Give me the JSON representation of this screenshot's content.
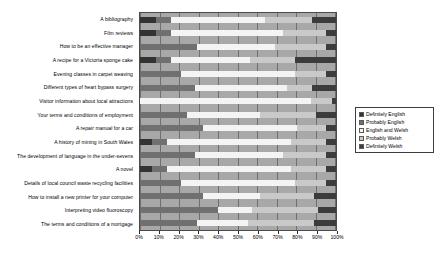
{
  "chart_data": {
    "type": "bar",
    "orientation": "horizontal",
    "stacked": true,
    "normalized_percent": true,
    "title": "",
    "subtitle": "",
    "xlabel": "",
    "ylabel": "",
    "xlim": [
      0,
      100
    ],
    "grid": true,
    "legend_position": "right",
    "xticks": [
      "0%",
      "10%",
      "20%",
      "30%",
      "40%",
      "50%",
      "60%",
      "70%",
      "80%",
      "90%",
      "100%"
    ],
    "xtick_values": [
      0,
      10,
      20,
      30,
      40,
      50,
      60,
      70,
      80,
      90,
      100
    ],
    "categories": [
      "A bibliography",
      "Film reviews",
      "How to be an effective manager",
      "A recipe for a Victoria sponge cake",
      "Evening classes in carpet weaving",
      "Different types of heart bypass surgery",
      "Visitor information about local attractions",
      "Your terms and conditions of employment",
      "A repair manual for a car",
      "A history of mining in South Wales",
      "The development of language in the under-sevens",
      "A novel",
      "Details of local council waste recycling facilities",
      "How to install a new printer for your computer",
      "Interpreting video fluoroscopy",
      "The terms and conditions of a mortgage"
    ],
    "series": [
      {
        "name": "Definitely English",
        "color": "#333333",
        "values": [
          8,
          8,
          0,
          8,
          0,
          0,
          0,
          0,
          0,
          6,
          0,
          6,
          0,
          0,
          0,
          0
        ]
      },
      {
        "name": "Probably English",
        "color": "#707070",
        "values": [
          8,
          8,
          29,
          8,
          21,
          28,
          0,
          24,
          32,
          8,
          28,
          8,
          21,
          32,
          40,
          29
        ]
      },
      {
        "name": "English and Welsh",
        "color": "#f4f4f4",
        "values": [
          48,
          57,
          40,
          40,
          58,
          47,
          87,
          37,
          48,
          63,
          45,
          63,
          58,
          29,
          17,
          26
        ]
      },
      {
        "name": "Probably Welsh",
        "color": "#c9c9c9",
        "values": [
          24,
          22,
          26,
          23,
          16,
          13,
          11,
          29,
          15,
          18,
          22,
          18,
          16,
          28,
          34,
          34
        ]
      },
      {
        "name": "Definitely Welsh",
        "color": "#3c3c3c",
        "values": [
          12,
          5,
          5,
          21,
          5,
          12,
          2,
          10,
          5,
          5,
          5,
          5,
          5,
          11,
          9,
          11
        ]
      }
    ]
  },
  "legend": {
    "items": [
      {
        "label": "Definitely English"
      },
      {
        "label": "Probably English"
      },
      {
        "label": "English and Welsh"
      },
      {
        "label": "Probably Welsh"
      },
      {
        "label": "Definitely Welsh"
      }
    ]
  }
}
